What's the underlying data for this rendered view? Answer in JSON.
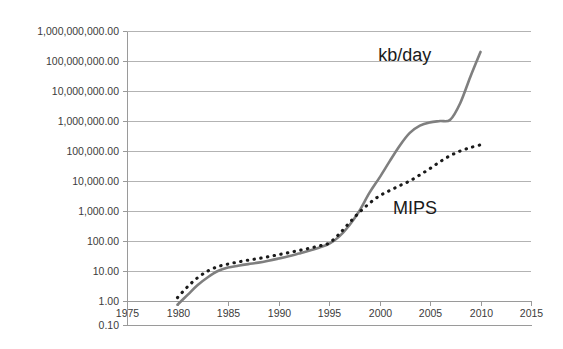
{
  "chart_data": {
    "type": "line",
    "title": "",
    "subtitle": "",
    "xlabel": "",
    "ylabel": "",
    "yscale": "log",
    "xlim": [
      1975,
      2015
    ],
    "ylim": [
      0.1,
      1000000000
    ],
    "grid": true,
    "legend_position": "inline-annotation",
    "y_tick_labels": [
      "1,000,000,000.00",
      "100,000,000.00",
      "10,000,000.00",
      "1,000,000.00",
      "100,000.00",
      "10,000.00",
      "1,000.00",
      "100.00",
      "10.00",
      "1.00",
      "0.10"
    ],
    "y_tick_values": [
      1000000000,
      100000000,
      10000000,
      1000000,
      100000,
      10000,
      1000,
      100,
      10,
      1,
      0.1
    ],
    "x_tick_labels": [
      "1975",
      "1980",
      "1985",
      "1990",
      "1995",
      "2000",
      "2005",
      "2010",
      "2015"
    ],
    "x_tick_values": [
      1975,
      1980,
      1985,
      1990,
      1995,
      2000,
      2005,
      2010,
      2015
    ],
    "annotations": [
      {
        "text": "kb/day",
        "x": 2002.5,
        "y": 160000000
      },
      {
        "text": "MIPS",
        "x": 2003.5,
        "y": 1300
      }
    ],
    "series": [
      {
        "name": "kb/day",
        "style": "solid",
        "color": "#7f7f7f",
        "x": [
          1980,
          1981,
          1982,
          1983,
          1984,
          1985,
          1986,
          1987,
          1988,
          1989,
          1990,
          1991,
          1992,
          1993,
          1994,
          1995,
          1996,
          1997,
          1998,
          1999,
          2000,
          2001,
          2002,
          2003,
          2004,
          2005,
          2006,
          2007,
          2008,
          2009,
          2010
        ],
        "y": [
          0.7,
          1.6,
          3.4,
          6.2,
          10.0,
          13.0,
          15.0,
          17.0,
          19.0,
          22.0,
          26.0,
          31.0,
          38.0,
          47.0,
          60.0,
          80.0,
          140.0,
          330.0,
          1000.0,
          4000.0,
          13000.0,
          45000.0,
          150000.0,
          400000.0,
          700000.0,
          900000.0,
          1000000.0,
          1100000.0,
          4000000.0,
          30000000.0,
          200000000.0
        ]
      },
      {
        "name": "MIPS",
        "style": "dotted",
        "color": "#1a1a1a",
        "x": [
          1980,
          1981,
          1982,
          1983,
          1984,
          1985,
          1986,
          1987,
          1988,
          1989,
          1990,
          1991,
          1992,
          1993,
          1994,
          1995,
          1996,
          1997,
          1998,
          1999,
          2000,
          2001,
          2002,
          2003,
          2004,
          2005,
          2006,
          2007,
          2008,
          2009,
          2010
        ],
        "y": [
          1.3,
          3.0,
          6.0,
          10.0,
          14.0,
          17.0,
          20.0,
          23.0,
          26.0,
          30.0,
          35.0,
          41.0,
          48.0,
          57.0,
          68.0,
          85.0,
          170.0,
          400.0,
          900.0,
          1800.0,
          3200.0,
          4800.0,
          7000.0,
          10000.0,
          16000.0,
          26000.0,
          44000.0,
          70000.0,
          100000.0,
          130000.0,
          160000.0
        ]
      }
    ]
  },
  "colors": {
    "background": "#ffffff",
    "gridline": "#b3b3b3",
    "axis": "#9a9a9a",
    "tick_text": "#3b3b3b",
    "annotation_text": "#1a1a1a",
    "series_kb_day": "#7f7f7f",
    "series_mips": "#1a1a1a"
  }
}
